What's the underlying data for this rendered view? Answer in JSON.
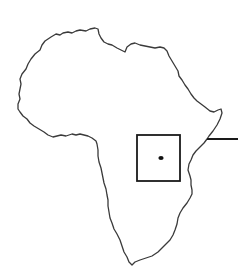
{
  "map": {
    "subject": "Africa outline",
    "colors": {
      "background": "#ffffff",
      "outline": "#3a3a3a",
      "box": "#1a1a1a",
      "marker": "#111111"
    },
    "inset_box": {
      "x": 137,
      "y": 135,
      "width": 43,
      "height": 46
    },
    "marker_dot": {
      "cx": 161,
      "cy": 158
    },
    "leader_line": {
      "x1": 207,
      "y1": 139,
      "x2": 238,
      "y2": 139
    }
  }
}
